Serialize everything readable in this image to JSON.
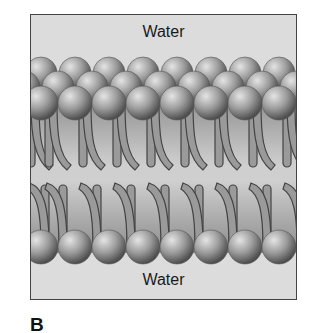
{
  "figure": {
    "panel_label": "B",
    "top_region_label": "Water",
    "bottom_region_label": "Water",
    "colors": {
      "background": "#dcdcdc",
      "border": "#444444",
      "head_light": "#d8d8d8",
      "head_dark": "#5a5a5a",
      "tail_fill": "#9a9a9a",
      "tail_outline": "#444444",
      "core_fill": "#a8a8a8"
    }
  }
}
